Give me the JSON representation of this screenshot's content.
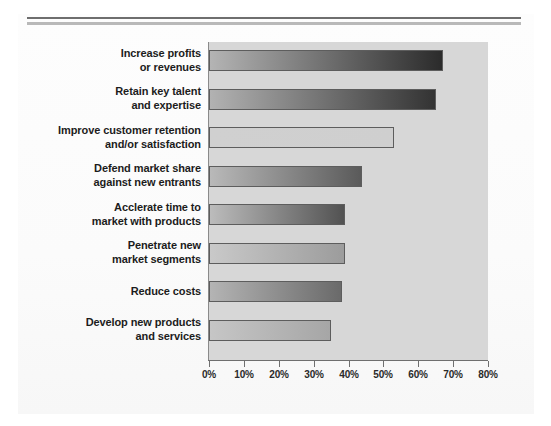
{
  "page": {
    "background_color": "#ffffff",
    "rules": [
      {
        "name": "top-rule-dark",
        "color": "#6e6e6e"
      },
      {
        "name": "top-rule-light",
        "color": "#b9b9b9"
      }
    ]
  },
  "chart_data": {
    "type": "bar",
    "orientation": "horizontal",
    "title": "",
    "subtitle": "",
    "xlabel": "",
    "ylabel": "",
    "xlim": [
      0,
      80
    ],
    "grid": false,
    "legend": null,
    "plot_background_color": "#d7d7d7",
    "bar_border_color": "#5d5d5d",
    "tick_labels": [
      "0%",
      "10%",
      "20%",
      "30%",
      "40%",
      "50%",
      "60%",
      "70%",
      "80%"
    ],
    "tick_values": [
      0,
      10,
      20,
      30,
      40,
      50,
      60,
      70,
      80
    ],
    "categories": [
      "Increase profits or revenues",
      "Retain key talent and expertise",
      "Improve customer retention and/or satisfaction",
      "Defend market share against new entrants",
      "Acclerate time to market with products",
      "Penetrate new market segments",
      "Reduce costs",
      "Develop new products and services"
    ],
    "category_lines": [
      [
        "Increase profits",
        "or revenues"
      ],
      [
        "Retain key talent",
        "and expertise"
      ],
      [
        "Improve customer retention",
        "and/or satisfaction"
      ],
      [
        "Defend market share",
        "against new entrants"
      ],
      [
        "Acclerate time to",
        "market with products"
      ],
      [
        "Penetrate new",
        "market segments"
      ],
      [
        "Reduce costs",
        ""
      ],
      [
        "Develop new products",
        "and services"
      ]
    ],
    "values": [
      67,
      65,
      53,
      44,
      39,
      39,
      38,
      35
    ],
    "bar_fill_start": [
      "#b4b4b4",
      "#b2b2b2",
      "#d0d0d0",
      "#b9b9b9",
      "#bcbcbc",
      "#c9c9c9",
      "#b4b4b4",
      "#c6c6c6"
    ],
    "bar_fill_end": [
      "#2b2b2b",
      "#333333",
      "#cfcfcf",
      "#5a5a5a",
      "#525252",
      "#9c9c9c",
      "#6a6a6a",
      "#a6a6a6"
    ]
  }
}
